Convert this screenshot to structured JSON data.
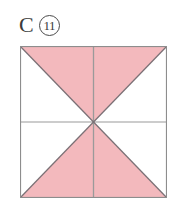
{
  "figure": {
    "label": {
      "letter": "C",
      "number": "11",
      "number_style": "circled"
    },
    "shape": {
      "name": "square",
      "description": "Square divided by both diagonals and both midlines into regions; the top and bottom triangles formed by the diagonals are shaded.",
      "shaded_regions": [
        "top-triangle",
        "bottom-triangle"
      ],
      "unshaded_regions": [
        "left-triangle",
        "right-triangle"
      ],
      "fraction_shaded": "1/2",
      "guide_lines": [
        "vertical-midline",
        "horizontal-midline",
        "diagonal-tl-br",
        "diagonal-tr-bl"
      ]
    },
    "colors": {
      "shaded_fill": "#f3b9bd",
      "unshaded_fill": "#ffffff",
      "outline": "#8d8d8d",
      "diagonal_line": "#7a7075",
      "midline": "#9a9a9a",
      "background": "#ffffff",
      "label_text": "#3b3b3b"
    },
    "geometry": {
      "square_left": 20,
      "square_top": 46,
      "square_width": 147,
      "square_height": 152,
      "center_x": 93,
      "center_y": 122
    }
  }
}
